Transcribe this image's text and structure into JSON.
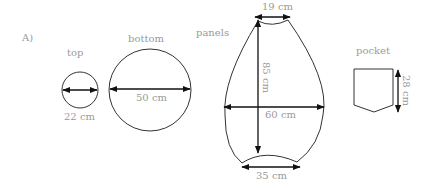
{
  "figure": {
    "label": "A)",
    "pieces": {
      "top": {
        "name": "top",
        "dimension": "22 cm",
        "shape": "circle"
      },
      "bottom": {
        "name": "bottom",
        "dimension": "50 cm",
        "shape": "circle"
      },
      "panels": {
        "name": "panels",
        "top_width": "19 cm",
        "height": "85 cm",
        "max_width": "60 cm",
        "bottom_width": "35 cm",
        "shape": "teardrop-panel"
      },
      "pocket": {
        "name": "pocket",
        "height": "28 cm",
        "shape": "pentagon-pocket"
      }
    }
  }
}
